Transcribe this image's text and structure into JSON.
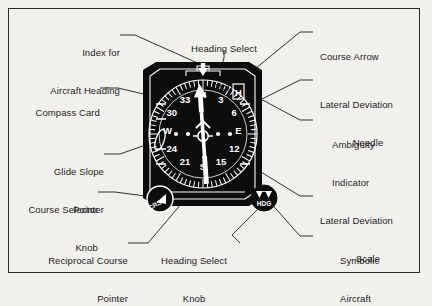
{
  "figure": {
    "background_color": "#f2f0ec",
    "ink_color": "#1c1c1c",
    "instrument_face_color": "#0d0d0d",
    "instrument_marking_color": "#ffffff"
  },
  "callouts": [
    {
      "id": "index-for-aircraft-heading",
      "line1": "Index for",
      "line2": "Aircraft Heading",
      "side": "left"
    },
    {
      "id": "compass-card",
      "line1": "Compass Card",
      "line2": "",
      "side": "left"
    },
    {
      "id": "glide-slope-pointer",
      "line1": "Glide Slope",
      "line2": "Pointer",
      "side": "left"
    },
    {
      "id": "course-selector-knob",
      "line1": "Course Selector",
      "line2": "Knob",
      "side": "left"
    },
    {
      "id": "reciprocal-course-pointer",
      "line1": "Reciprocal Course",
      "line2": "Pointer",
      "side": "left"
    },
    {
      "id": "heading-select-bug",
      "line1": "Heading Select",
      "line2": "Bug",
      "side": "top"
    },
    {
      "id": "heading-select-knob",
      "line1": "Heading Select",
      "line2": "Knob",
      "side": "bottom"
    },
    {
      "id": "course-arrow",
      "line1": "Course Arrow",
      "line2": "",
      "side": "right"
    },
    {
      "id": "lateral-deviation-needle",
      "line1": "Lateral Deviation",
      "line2": "Needle",
      "side": "right"
    },
    {
      "id": "ambiguity-indicator",
      "line1": "Ambiguity",
      "line2": "Indicator",
      "side": "right"
    },
    {
      "id": "lateral-deviation-scale",
      "line1": "Lateral Deviation",
      "line2": "Scale",
      "side": "right"
    },
    {
      "id": "symbolic-aircraft",
      "line1": "Symbolic",
      "line2": "Aircraft",
      "side": "right"
    }
  ],
  "instrument": {
    "compass_numerals": [
      "N",
      "3",
      "6",
      "E",
      "12",
      "15",
      "S",
      "21",
      "24",
      "W",
      "30",
      "33"
    ],
    "compass_major_labels": [
      "N",
      "33",
      "30",
      "W",
      "24",
      "21",
      "S",
      "15",
      "12",
      "E",
      "6",
      "3"
    ],
    "course_selector_knob_label": "CRS",
    "heading_select_knob_label": "HDG",
    "ambiguity_flag_letter": "H",
    "deviation_dots_per_side": 2
  }
}
